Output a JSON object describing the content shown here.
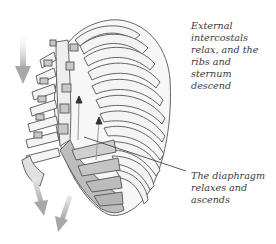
{
  "figure": {
    "colors": {
      "rib_fill": "#f4f4f4",
      "rib_stroke": "#555555",
      "cartilage_fill": "#c8c8c8",
      "diaphragm_fill": "#bdbdbd",
      "arrow_gray": "#b5b5b5",
      "arrow_dark": "#333333",
      "text": "#3a3a3a"
    }
  },
  "labels": {
    "intercostals": {
      "lines": [
        "External",
        "intercostals",
        "relax, and the",
        "ribs and",
        "sternum",
        "descend"
      ]
    },
    "diaphragm": {
      "lines": [
        "The diaphragm",
        "relaxes and",
        "ascends"
      ]
    }
  },
  "arrows": {
    "descend_left": "down-arrow",
    "descend_bottom": [
      "down-arrow",
      "down-arrow"
    ],
    "diaphragm_up": [
      "up-arrow",
      "up-arrow"
    ]
  }
}
